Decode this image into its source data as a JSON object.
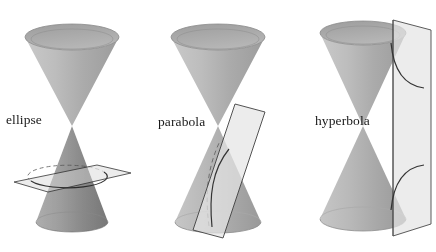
{
  "figure": {
    "background_color": "#ffffff",
    "panel_count": 3
  },
  "palette": {
    "background": "#ffffff",
    "cone_light": "#d2d2d2",
    "cone_mid": "#b4b4b4",
    "cone_dark": "#9a9a9a",
    "cone_rim_interior": "#a8a8a8",
    "cone_outline": "#6e6e6e",
    "plane_fill": "#e4e4e4",
    "plane_outline": "#4a4a4a",
    "curve_stroke": "#3a3a3a",
    "hidden_edge_stroke": "#707070",
    "label_color": "#191919"
  },
  "panels": [
    {
      "id": "ellipse",
      "label": "ellipse",
      "label_position": {
        "x": 6,
        "y": 113
      },
      "conic_type": "ellipse",
      "plane_orientation": "oblique-shallow",
      "plane_description": "A shallow tilted plane slicing entirely through the lower nappe, producing a closed elliptical curve.",
      "intersection_curve": "closed ellipse",
      "cuts_nappes": 1,
      "curve_visible_solid": true,
      "curve_has_hidden_dashed_arc": true,
      "cone_apex": {
        "x": 72,
        "y": 126
      }
    },
    {
      "id": "parabola",
      "label": "parabola",
      "label_position": {
        "x": 158,
        "y": 115
      },
      "conic_type": "parabola",
      "plane_orientation": "oblique-parallel-to-slant",
      "plane_description": "A steeply tilted narrow plane parallel to one slant line of the cone, cutting only the lower nappe and producing an open parabolic curve.",
      "intersection_curve": "open parabola",
      "cuts_nappes": 1,
      "curve_visible_solid": true,
      "curve_has_hidden_dashed_arc": true,
      "cone_apex": {
        "x": 218,
        "y": 126
      }
    },
    {
      "id": "hyperbola",
      "label": "hyperbola",
      "label_position": {
        "x": 315,
        "y": 114
      },
      "conic_type": "hyperbola",
      "plane_orientation": "vertical",
      "plane_description": "A near-vertical plane cutting both nappes of the double cone, producing two opposing hyperbolic branches.",
      "intersection_curve": "two-branch hyperbola",
      "cuts_nappes": 2,
      "curve_visible_solid": true,
      "curve_has_hidden_dashed_arc": false,
      "cone_apex": {
        "x": 363,
        "y": 126
      }
    }
  ]
}
